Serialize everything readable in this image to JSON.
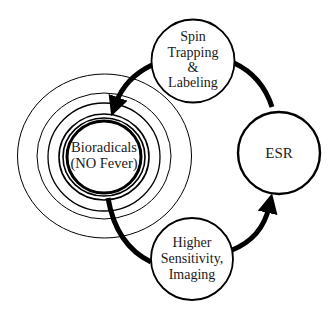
{
  "diagram": {
    "type": "cycle",
    "nodes": [
      {
        "id": "bioradicals",
        "lines": [
          "Bioradicals",
          "(NO Fever)"
        ]
      },
      {
        "id": "spin_trapping",
        "lines": [
          "Spin",
          "Trapping",
          "&",
          "Labeling"
        ]
      },
      {
        "id": "esr",
        "lines": [
          "ESR"
        ]
      },
      {
        "id": "higher_sensitivity",
        "lines": [
          "Higher",
          "Sensitivity,",
          "Imaging"
        ]
      }
    ],
    "edges": [
      {
        "from": "spin_trapping",
        "to": "bioradicals",
        "arrow": true
      },
      {
        "from": "esr",
        "to": "spin_trapping",
        "arrow": false
      },
      {
        "from": "bioradicals",
        "to": "higher_sensitivity",
        "arrow": false
      },
      {
        "from": "higher_sensitivity",
        "to": "esr",
        "arrow": true
      }
    ],
    "colors": {
      "stroke": "#000000",
      "background": "#ffffff",
      "text": "#1a1a1a"
    }
  }
}
